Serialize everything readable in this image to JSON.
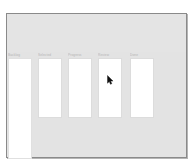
{
  "screen": {
    "width": 193,
    "height": 167,
    "background_color": "#ffffff"
  },
  "window": {
    "name": "application-window",
    "background_color": "#e3e3e3",
    "border_color": "#8a8a8a",
    "header": {
      "label": ""
    }
  },
  "columns": [
    {
      "label": "Backlog",
      "left": 1,
      "width": 24,
      "height": 101,
      "tall": true
    },
    {
      "label": "Selected",
      "left": 31,
      "width": 24,
      "height": 60,
      "tall": false
    },
    {
      "label": "Progress",
      "left": 61,
      "width": 24,
      "height": 60,
      "tall": false
    },
    {
      "label": "Review",
      "left": 91,
      "width": 24,
      "height": 60,
      "tall": false
    },
    {
      "label": "Done",
      "left": 123,
      "width": 24,
      "height": 60,
      "tall": false
    }
  ],
  "cursor": {
    "name": "mouse-pointer",
    "x": 107,
    "y": 71,
    "color": "#101010"
  },
  "colors": {
    "panel_grey": "#e3e3e3",
    "card_white": "#ffffff",
    "card_border": "#dcdcdc",
    "window_border": "#8a8a8a",
    "label_grey": "#b4b4b4"
  }
}
